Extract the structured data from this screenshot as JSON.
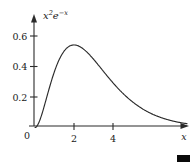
{
  "figure": {
    "name": "function-plot",
    "background_color": "#ffffff",
    "ink_color": "#2b2b2b",
    "function_label": {
      "full_text": "x²e⁻ˣ",
      "base_var": "x",
      "exponent_1": "2",
      "e_symbol": "e",
      "exponent_2": "−x"
    },
    "qed_marker": {
      "name": "end-of-proof-marker",
      "color": "#0a0a0a",
      "shape": "filled-rectangle"
    }
  },
  "chart_data": {
    "type": "line",
    "title": "",
    "subtitle": "",
    "function": "x^2 * e^(-x)",
    "annotations": [
      "x²e⁻ˣ"
    ],
    "xlabel": "x",
    "ylabel": "",
    "xlim": [
      -0.35,
      8.3
    ],
    "ylim": [
      -0.045,
      0.69
    ],
    "xticks": [
      2,
      4
    ],
    "xticklabels": [
      "2",
      "4"
    ],
    "yticks": [
      0.2,
      0.4,
      0.6
    ],
    "yticklabels": [
      "0.2",
      "0.4",
      "0.6"
    ],
    "origin_label": "0",
    "grid": false,
    "legend": null,
    "axes_style": "arrowed-spines",
    "peak": {
      "x": 2,
      "y": 0.541
    },
    "x": [
      0,
      0.2,
      0.4,
      0.6,
      0.8,
      1.0,
      1.2,
      1.4,
      1.6,
      1.8,
      2.0,
      2.2,
      2.4,
      2.6,
      2.8,
      3.0,
      3.4,
      3.8,
      4.2,
      4.6,
      5.0,
      5.5,
      6.0,
      6.5,
      7.0,
      7.5,
      7.8
    ],
    "y": [
      0.0,
      0.0327,
      0.1073,
      0.1976,
      0.2875,
      0.3679,
      0.4338,
      0.4834,
      0.517,
      0.5362,
      0.5413,
      0.5375,
      0.5228,
      0.502,
      0.4773,
      0.4481,
      0.3866,
      0.3232,
      0.2652,
      0.2144,
      0.1684,
      0.1236,
      0.0892,
      0.0634,
      0.0446,
      0.0311,
      0.0249
    ]
  }
}
